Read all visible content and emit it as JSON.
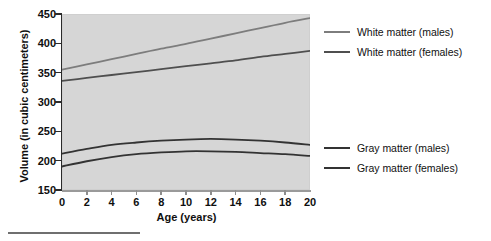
{
  "chart_data": {
    "type": "line",
    "title": "",
    "xlabel": "Age (years)",
    "ylabel": "Volume (in cubic centimeters)",
    "xlim": [
      0,
      20
    ],
    "ylim": [
      150,
      450
    ],
    "xticks": [
      "0",
      "2",
      "4",
      "6",
      "8",
      "10",
      "12",
      "14",
      "16",
      "18",
      "20"
    ],
    "yticks": [
      "150",
      "200",
      "250",
      "300",
      "350",
      "400",
      "450"
    ],
    "grid": false,
    "legend_position": "right",
    "x": [
      0,
      2,
      4,
      6,
      8,
      10,
      12,
      14,
      16,
      18,
      20
    ],
    "series": [
      {
        "name": "White matter (males)",
        "color": "#7d7d7d",
        "values": [
          355,
          364,
          373,
          382,
          391,
          399,
          408,
          417,
          426,
          435,
          443
        ]
      },
      {
        "name": "White matter (females)",
        "color": "#4f4f4f",
        "values": [
          336,
          341,
          346,
          351,
          356,
          361,
          366,
          371,
          377,
          382,
          387
        ]
      },
      {
        "name": "Gray matter (males)",
        "color": "#333333",
        "values": [
          212,
          220,
          227,
          231,
          234,
          236,
          237,
          236,
          234,
          231,
          227
        ]
      },
      {
        "name": "Gray matter (females)",
        "color": "#333333",
        "values": [
          190,
          199,
          206,
          211,
          214,
          216,
          216,
          215,
          213,
          211,
          208
        ]
      }
    ]
  },
  "legend": {
    "entries": [
      {
        "label": "White matter (males)",
        "color": "#7d7d7d"
      },
      {
        "label": "White matter (females)",
        "color": "#4f4f4f"
      },
      {
        "label": "Gray matter (males)",
        "color": "#333333"
      },
      {
        "label": "Gray matter (females)",
        "color": "#333333"
      }
    ]
  },
  "colors": {
    "plot_background": "#d6d6d6",
    "axis": "#2b2b2b",
    "text": "#0f0f0f"
  }
}
